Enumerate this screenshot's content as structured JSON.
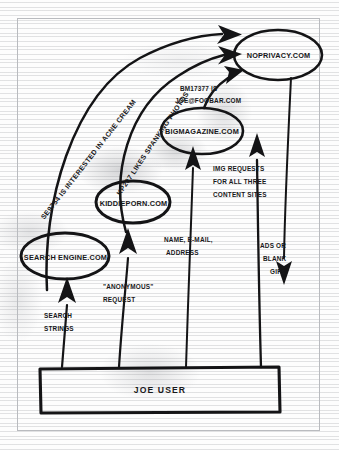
{
  "figure": {
    "kind": "hand-drawn-flow-diagram",
    "medium": "scanned notebook paper",
    "ink_color": "#18181a",
    "paper_color": "#fdfdfd",
    "frame_color": "#b9bbbf"
  },
  "nodes": [
    {
      "id": "noprivacy",
      "label": "NOPRIVACY.COM",
      "shape": "ellipse"
    },
    {
      "id": "bigmagazine",
      "label": "BIGMAGAZINE.COM",
      "shape": "ellipse"
    },
    {
      "id": "kiddieporn",
      "label": "KIDDIEPORN.COM",
      "shape": "ellipse"
    },
    {
      "id": "searchengine",
      "label": "SEARCH ENGINE.COM",
      "shape": "ellipse"
    },
    {
      "id": "joeuser",
      "label": "JOE USER",
      "shape": "rectangle"
    }
  ],
  "flow_labels": {
    "search_engine_to_noprivacy": "SE9754  IS INTERESTED IN ACNE CREAM",
    "kiddieporn_to_noprivacy": "KP207 LIKES SPANKING PHOTOS",
    "bigmagazine_to_noprivacy_line1": "BM17377 IS",
    "bigmagazine_to_noprivacy_line2": "JOE@FOOBAR.COM",
    "img_requests_line1": "IMG REQUESTS",
    "img_requests_line2": "FOR ALL THREE",
    "img_requests_line3": "CONTENT SITES",
    "ads_or_blank_line1": "ADS OR",
    "ads_or_blank_line2": "BLANK",
    "ads_or_blank_line3": "GIFs",
    "name_email_line1": "NAME, E-MAIL,",
    "name_email_line2": "ADDRESS",
    "anonymous_request_line1": "\"ANONYMOUS\"",
    "anonymous_request_line2": "REQUEST",
    "search_strings_line1": "SEARCH",
    "search_strings_line2": "STRINGS"
  }
}
